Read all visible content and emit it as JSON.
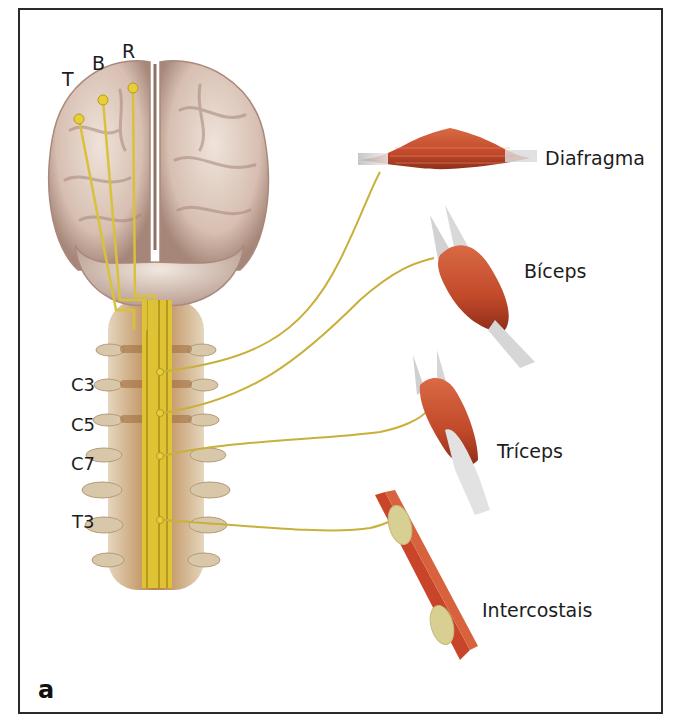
{
  "figure": {
    "panel_label": "a",
    "cortex_labels": [
      {
        "id": "T",
        "text": "T"
      },
      {
        "id": "B",
        "text": "B"
      },
      {
        "id": "R",
        "text": "R"
      }
    ],
    "spinal_levels": [
      {
        "id": "C3",
        "text": "C3"
      },
      {
        "id": "C5",
        "text": "C5"
      },
      {
        "id": "C7",
        "text": "C7"
      },
      {
        "id": "T3",
        "text": "T3"
      }
    ],
    "muscles": [
      {
        "id": "diafragma",
        "text": "Diafragma",
        "level": "C3"
      },
      {
        "id": "biceps",
        "text": "Bíceps",
        "level": "C5"
      },
      {
        "id": "triceps",
        "text": "Tríceps",
        "level": "C7"
      },
      {
        "id": "intercostais",
        "text": "Intercostais",
        "level": "T3"
      }
    ],
    "colors": {
      "border": "#2a2a2a",
      "nerve": "#d9c23a",
      "nerve_dark": "#b59a1e",
      "brain": "#d9c2b6",
      "brain_shadow": "#9d7f73",
      "spine": "#c7a884",
      "muscle": "#c2492a",
      "tendon": "#d8d8d8"
    }
  }
}
